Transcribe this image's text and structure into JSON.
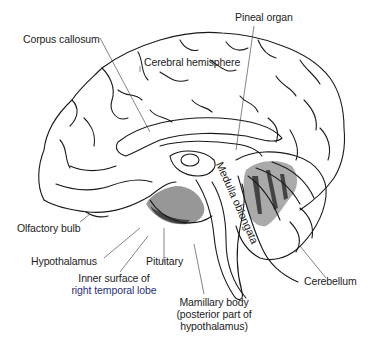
{
  "diagram": {
    "labels": {
      "corpus_callosum": "Corpus callosum",
      "pineal_organ": "Pineal organ",
      "cerebral_hemisphere": "Cerebral hemisphere",
      "olfactory_bulb": "Olfactory bulb",
      "hypothalamus": "Hypothalamus",
      "pituitary": "Pituitary",
      "inner_surface_line1": "Inner surface of",
      "inner_surface_line2_a": "right ",
      "inner_surface_line2_b": "temporal lobe",
      "medulla_oblongata": "Medulla oblongata",
      "cerebellum": "Cerebellum",
      "mamillary_line1": "Mamillary body",
      "mamillary_line2": "(posterior part of",
      "mamillary_line3": "hypothalamus)"
    },
    "colors": {
      "ink": "#1a1a1a",
      "background": "#ffffff",
      "accent_text": "#2a2f7a"
    }
  }
}
